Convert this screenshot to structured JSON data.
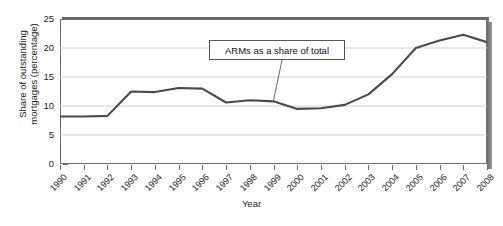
{
  "page": {
    "cut_top_text": "",
    "cut_bottom_text": ""
  },
  "chart_data": {
    "type": "line",
    "title": "",
    "xlabel": "Year",
    "ylabel": "Share of outstanding mortgages (percentage)",
    "ylabel_line1": "Share of outstanding",
    "ylabel_line2": "mortgages (percentage)",
    "categories": [
      "1990",
      "1991",
      "1992",
      "1993",
      "1994",
      "1995",
      "1996",
      "1997",
      "1998",
      "1999",
      "2000",
      "2001",
      "2002",
      "2003",
      "2004",
      "2005",
      "2006",
      "2007",
      "2008"
    ],
    "values": [
      8.2,
      8.2,
      8.3,
      12.5,
      12.4,
      13.1,
      13.0,
      10.6,
      11.0,
      10.8,
      9.5,
      9.6,
      10.2,
      12.0,
      15.5,
      20.0,
      21.3,
      22.3,
      21.0
    ],
    "series": [
      {
        "name": "ARMs as a share of total",
        "values": [
          8.2,
          8.2,
          8.3,
          12.5,
          12.4,
          13.1,
          13.0,
          10.6,
          11.0,
          10.8,
          9.5,
          9.6,
          10.2,
          12.0,
          15.5,
          20.0,
          21.3,
          22.3,
          21.0
        ]
      }
    ],
    "ylim": [
      0,
      25
    ],
    "yticks": [
      0,
      5,
      10,
      15,
      20,
      25
    ],
    "ytick_labels": [
      "0",
      "5",
      "10",
      "15",
      "20",
      "25"
    ],
    "xlim": [
      "1990",
      "2008"
    ],
    "grid": "horizontal",
    "legend": "none",
    "annotations": [
      {
        "text": "ARMs as a share of total",
        "points_to_year": "1999",
        "points_to_value": 10.8
      }
    ],
    "line_color": "#4a4a4a",
    "grid_color": "#d2d2d2",
    "frame_color": "#6f6f6f"
  }
}
